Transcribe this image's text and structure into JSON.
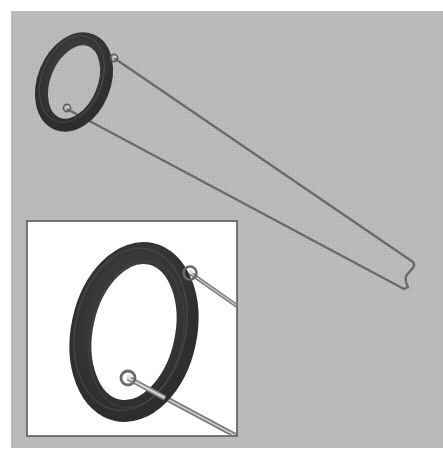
{
  "figure": {
    "description": "Illustration of a rubber O-ring held by a bent wire tool with two hooked eyes, with a magnified inset of the ring and eyes",
    "colors": {
      "page_background": "#ffffff",
      "panel_background": "#b9b9b9",
      "inset_background": "#ffffff",
      "inset_border": "#5a5a5a",
      "ring_color": "#3a3a3a",
      "ring_highlight": "#5e5e5e",
      "wire_color": "#6a6a6a",
      "wire_highlight": "#bdbdbd"
    },
    "main_view": {
      "label": "O-ring on wire tool"
    },
    "inset": {
      "label": "Magnified view of O-ring and wire eyes"
    }
  }
}
